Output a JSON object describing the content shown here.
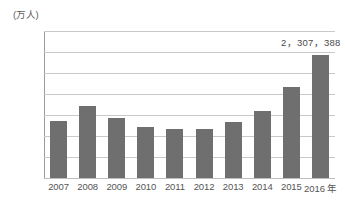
{
  "chart_data": {
    "type": "bar",
    "title": "",
    "xlabel": "",
    "ylabel": "(万人)",
    "x_axis_suffix": "年",
    "categories": [
      "2007",
      "2008",
      "2009",
      "2010",
      "2011",
      "2012",
      "2013",
      "2014",
      "2015",
      "2016"
    ],
    "values": [
      207.0,
      214.5,
      208.5,
      204.5,
      203.5,
      203.5,
      206.5,
      212.0,
      223.5,
      238.5
    ],
    "ylim": [
      180,
      250
    ],
    "y_ticks": [
      180,
      190,
      200,
      210,
      220,
      230,
      240,
      250
    ],
    "y_tick_labels": [
      "180",
      "190",
      "200",
      "210",
      "220",
      "230",
      "240",
      "250"
    ],
    "grid": true,
    "grid_axis": "y",
    "legend": false,
    "legend_position": "none",
    "annotations": [
      {
        "text": "2，307，388",
        "target_category": "2016",
        "value": 238.5
      }
    ],
    "series": [
      {
        "name": "",
        "values": [
          207.0,
          214.5,
          208.5,
          204.5,
          203.5,
          203.5,
          206.5,
          212.0,
          223.5,
          238.5
        ],
        "color": "#6f6f6f"
      }
    ],
    "colors": {
      "bar": "#6f6f6f",
      "gridline": "#c9c9c9",
      "axis": "#9a9a9a",
      "text": "#555555",
      "background": "#ffffff"
    }
  }
}
